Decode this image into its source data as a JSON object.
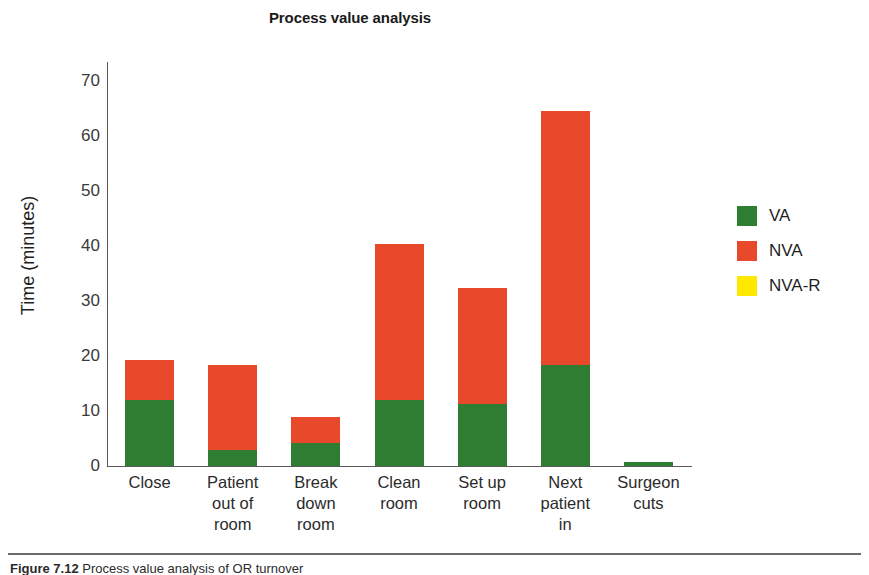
{
  "figure": {
    "caption_label": "Figure 7.12",
    "caption_text": "Process value analysis of OR turnover"
  },
  "colors": {
    "va": "#2e7d32",
    "nva": "#e8492b",
    "nva_r": "#ffe800",
    "axis": "#595959",
    "text": "#1f1f1f"
  },
  "chart_data": {
    "type": "bar",
    "subtype": "stacked",
    "title": "Process value analysis",
    "xlabel": "",
    "ylabel": "Time (minutes)",
    "ylim": [
      0,
      73.5
    ],
    "yticks": [
      0,
      10,
      20,
      30,
      40,
      50,
      60,
      70
    ],
    "ytick_labels": [
      "0",
      "10",
      "20",
      "30",
      "40",
      "50",
      "60",
      "70"
    ],
    "grid": false,
    "legend_position": "right",
    "categories": [
      "Close",
      "Patient\nout of\nroom",
      "Break\ndown\nroom",
      "Clean\nroom",
      "Set up\nroom",
      "Next\npatient\nin",
      "Surgeon\ncuts"
    ],
    "series": [
      {
        "name": "VA",
        "color": "#2e7d32",
        "values": [
          12.0,
          3.0,
          4.1,
          12.1,
          11.3,
          18.3,
          0.8
        ]
      },
      {
        "name": "NVA",
        "color": "#e8492b",
        "values": [
          7.3,
          15.3,
          4.9,
          28.3,
          21.0,
          46.2,
          0.0
        ]
      },
      {
        "name": "NVA-R",
        "color": "#ffe800",
        "values": [
          0.0,
          0.0,
          0.0,
          0.0,
          0.0,
          0.0,
          0.0
        ]
      }
    ],
    "totals": [
      19.3,
      18.3,
      9.0,
      40.4,
      32.3,
      64.5,
      0.8
    ]
  }
}
